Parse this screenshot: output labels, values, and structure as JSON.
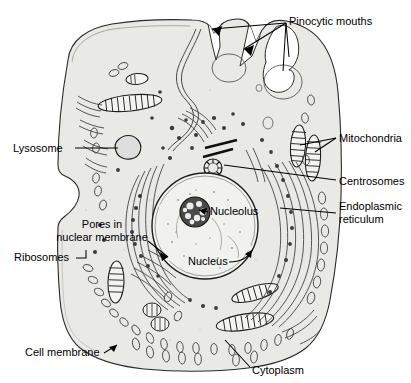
{
  "diagram": {
    "type": "labeled-biological-diagram",
    "background_color": "#ffffff",
    "cytoplasm_color": "#e9e9e6",
    "nucleus_color": "#f1f1ee",
    "ink_color": "#1a1a1a"
  },
  "labels": {
    "pinocytic_mouths": "Pinocytic mouths",
    "lysosome": "Lysosome",
    "mitochondria": "Mitochondria",
    "centrosomes": "Centrosomes",
    "endoplasmic_line1": "Endoplasmic",
    "endoplasmic_line2": "reticulum",
    "pores_line1": "Pores in",
    "pores_line2": "nuclear membrane",
    "ribosomes": "Ribosomes",
    "nucleolus": "Nucleolus",
    "nucleus": "Nucleus",
    "cell_membrane": "Cell membrane",
    "cytoplasm": "Cytoplasm"
  },
  "structures": [
    {
      "name": "pinocytic-mouths",
      "label": "Pinocytic mouths",
      "position": "top-edge",
      "count": 3
    },
    {
      "name": "lysosome",
      "label": "Lysosome",
      "position": "upper-left"
    },
    {
      "name": "mitochondria",
      "label": "Mitochondria",
      "position": "right",
      "count": 2
    },
    {
      "name": "centrosomes",
      "label": "Centrosomes",
      "position": "upper-center"
    },
    {
      "name": "endoplasmic-reticulum",
      "label": "Endoplasmic reticulum",
      "position": "around-nucleus"
    },
    {
      "name": "nuclear-pores",
      "label": "Pores in nuclear membrane",
      "position": "nucleus-edge"
    },
    {
      "name": "ribosomes",
      "label": "Ribosomes",
      "position": "left-edge"
    },
    {
      "name": "nucleolus",
      "label": "Nucleolus",
      "position": "nucleus-interior"
    },
    {
      "name": "nucleus",
      "label": "Nucleus",
      "position": "center"
    },
    {
      "name": "cell-membrane",
      "label": "Cell membrane",
      "position": "bottom-left-edge"
    },
    {
      "name": "cytoplasm",
      "label": "Cytoplasm",
      "position": "bottom-center"
    }
  ]
}
